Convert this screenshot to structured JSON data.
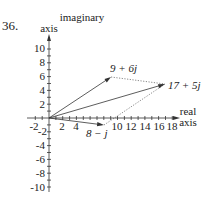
{
  "problem_number": "36.",
  "axes": {
    "y_label_line1": "imaginary",
    "y_label_line2": "axis",
    "x_label_line1": "real",
    "x_label_line2": "axis",
    "x_ticks": [
      "-2",
      "2",
      "4",
      "10",
      "12",
      "14",
      "16",
      "18"
    ],
    "y_ticks": [
      "10",
      "8",
      "6",
      "4",
      "2",
      "-2",
      "-4",
      "-6",
      "-8",
      "-10"
    ]
  },
  "vectors": [
    {
      "label": "9 + 6j",
      "re": 9,
      "im": 6,
      "style": "solid"
    },
    {
      "label": "17 + 5j",
      "re": 17,
      "im": 5,
      "style": "solid"
    },
    {
      "label": "8 − j",
      "re": 8,
      "im": -1,
      "style": "solid"
    }
  ],
  "parallelogram_edges": [
    {
      "from": "9 + 6j",
      "to": "17 + 5j",
      "style": "dotted"
    },
    {
      "from": "8 − j",
      "to": "17 + 5j",
      "style": "dotted"
    }
  ],
  "colors": {
    "ink": "#222222",
    "background": "#ffffff"
  }
}
